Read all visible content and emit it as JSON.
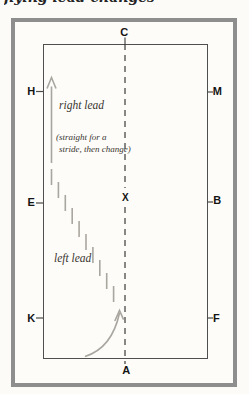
{
  "title_partial": "flying lead changes",
  "diagram": {
    "markers": {
      "c": "C",
      "h": "H",
      "m": "M",
      "e": "E",
      "b": "B",
      "k": "K",
      "f": "F",
      "a": "A",
      "x": "X"
    },
    "labels": {
      "right_lead": "right lead",
      "note_line1": "(straight for a",
      "note_line2": "stride, then change)",
      "left_lead": "left lead"
    },
    "colors": {
      "frame": "#8e8e8e",
      "arena_wall": "#4f4f4f",
      "center_line": "#3a3a3a",
      "path_marks": "#a9a69f",
      "letters": "#141414",
      "label_text": "#39352f",
      "background": "#fcfbf8"
    }
  }
}
